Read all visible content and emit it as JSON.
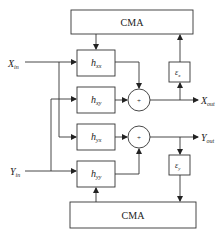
{
  "diagram": {
    "inputs": {
      "x_in": {
        "main": "X",
        "sub": "in"
      },
      "y_in": {
        "main": "Y",
        "sub": "in"
      }
    },
    "outputs": {
      "x_out": {
        "main": "X",
        "sub": "out"
      },
      "y_out": {
        "main": "Y",
        "sub": "out"
      }
    },
    "filters": [
      {
        "id": "hxx",
        "main": "h",
        "sub": "xx"
      },
      {
        "id": "hxy",
        "main": "h",
        "sub": "xy"
      },
      {
        "id": "hyx",
        "main": "h",
        "sub": "yx"
      },
      {
        "id": "hyy",
        "main": "h",
        "sub": "yy"
      }
    ],
    "adders": [
      {
        "id": "sum-x",
        "symbol": "+"
      },
      {
        "id": "sum-y",
        "symbol": "+"
      }
    ],
    "error_blocks": [
      {
        "id": "ex",
        "main": "ε",
        "sub": "x"
      },
      {
        "id": "ey",
        "main": "ε",
        "sub": "y"
      }
    ],
    "cma_blocks": [
      {
        "id": "cma-top",
        "label": "CMA"
      },
      {
        "id": "cma-bottom",
        "label": "CMA"
      }
    ],
    "colors": {
      "line": "#333333",
      "background": "#ffffff"
    }
  }
}
